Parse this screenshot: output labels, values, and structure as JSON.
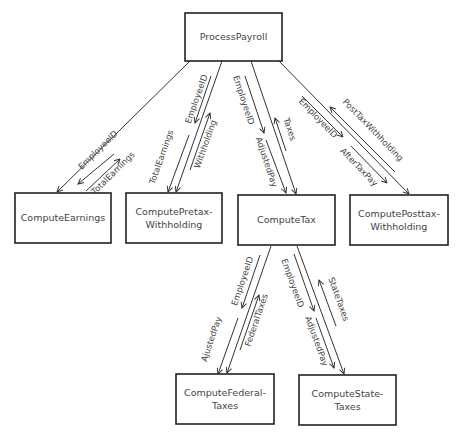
{
  "diagram": {
    "type": "structure-chart",
    "nodes": {
      "process_payroll": {
        "label": "ProcessPayroll",
        "lines": [
          "ProcessPayroll"
        ]
      },
      "compute_earnings": {
        "label": "ComputeEarnings",
        "lines": [
          "ComputeEarnings"
        ]
      },
      "compute_pretax": {
        "label": "ComputePretax-Withholding",
        "lines": [
          "ComputePretax-",
          "Withholding"
        ]
      },
      "compute_tax": {
        "label": "ComputeTax",
        "lines": [
          "ComputeTax"
        ]
      },
      "compute_posttax": {
        "label": "ComputePosttax-Withholding",
        "lines": [
          "ComputePosttax-",
          "Withholding"
        ]
      },
      "compute_federal": {
        "label": "ComputeFederal-Taxes",
        "lines": [
          "ComputeFederal-",
          "Taxes"
        ]
      },
      "compute_state": {
        "label": "ComputeState-Taxes",
        "lines": [
          "ComputeState-",
          "Taxes"
        ]
      }
    },
    "edges": {
      "earnings": {
        "from": "ProcessPayroll",
        "to": "ComputeEarnings",
        "flows": [
          {
            "label": "EmployeeID",
            "direction": "down"
          },
          {
            "label": "TotalEarnings",
            "direction": "up"
          }
        ]
      },
      "pretax": {
        "from": "ProcessPayroll",
        "to": "ComputePretax-Withholding",
        "flows": [
          {
            "label": "EmployeeID",
            "direction": "down"
          },
          {
            "label": "TotalEarnings",
            "direction": "down"
          },
          {
            "label": "Withholding",
            "direction": "up"
          }
        ]
      },
      "tax": {
        "from": "ProcessPayroll",
        "to": "ComputeTax",
        "flows": [
          {
            "label": "EmployeeID",
            "direction": "down"
          },
          {
            "label": "AdjustedPay",
            "direction": "down"
          },
          {
            "label": "Taxes",
            "direction": "up"
          }
        ]
      },
      "posttax": {
        "from": "ProcessPayroll",
        "to": "ComputePosttax-Withholding",
        "flows": [
          {
            "label": "EmployeeID",
            "direction": "down"
          },
          {
            "label": "AfterTaxPay",
            "direction": "down"
          },
          {
            "label": "PostTaxWithholding",
            "direction": "up"
          }
        ]
      },
      "federal": {
        "from": "ComputeTax",
        "to": "ComputeFederal-Taxes",
        "flows": [
          {
            "label": "EmployeeID",
            "direction": "down"
          },
          {
            "label": "AjustedPay",
            "direction": "down"
          },
          {
            "label": "FederalTaxes",
            "direction": "up"
          }
        ]
      },
      "state": {
        "from": "ComputeTax",
        "to": "ComputeState-Taxes",
        "flows": [
          {
            "label": "EmployeeID",
            "direction": "down"
          },
          {
            "label": "AdjustedPay",
            "direction": "down"
          },
          {
            "label": "StateTaxes",
            "direction": "up"
          }
        ]
      }
    }
  }
}
